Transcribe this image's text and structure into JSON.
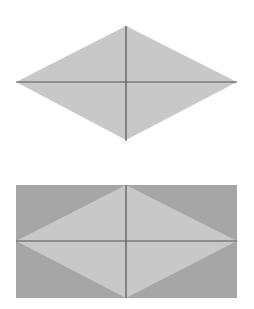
{
  "figures": [
    {
      "name": "rhombus-with-diagonals",
      "vertices": {
        "left": [
          16,
          82
        ],
        "top": [
          126,
          26
        ],
        "right": [
          237,
          82
        ],
        "bottom": [
          126,
          140
        ]
      },
      "diagonals": [
        {
          "from": [
            16,
            82
          ],
          "to": [
            237,
            82
          ]
        },
        {
          "from": [
            126,
            26
          ],
          "to": [
            126,
            140
          ]
        }
      ],
      "fill": "#c8c8c8",
      "line_color": "#555555"
    },
    {
      "name": "rhombus-in-rectangle",
      "rect": {
        "x": 16,
        "y": 185,
        "width": 221,
        "height": 113
      },
      "rect_fill": "#a6a6a6",
      "rhombus": {
        "left": [
          16,
          241
        ],
        "top": [
          126,
          185
        ],
        "right": [
          237,
          241
        ],
        "bottom": [
          126,
          298
        ]
      },
      "rhombus_fill": "#c8c8c8",
      "line_color": "#555555"
    }
  ],
  "colors": {
    "background": "#ffffff",
    "light_fill": "#c8c8c8",
    "dark_fill": "#a6a6a6",
    "line": "#555555"
  }
}
